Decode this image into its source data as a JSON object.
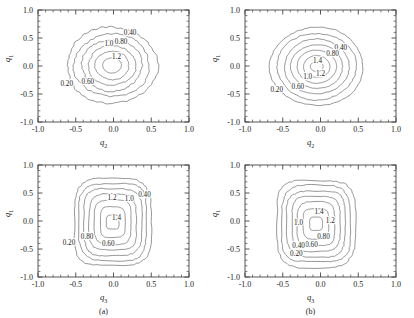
{
  "figure": {
    "type": "contour-figure",
    "panel_count": 4,
    "line_color": "#555555",
    "frame_color": "#444444",
    "background": "#ffffff"
  },
  "axes": {
    "x_ticks": [
      "-1.0",
      "-0.5",
      "0.0",
      "0.5",
      "1.0"
    ],
    "y_ticks": [
      "-1.0",
      "-0.5",
      "0.0",
      "0.5",
      "1.0"
    ],
    "xlim": [
      -1.0,
      1.0
    ],
    "ylim": [
      -1.0,
      1.0
    ],
    "minor_ticks_per_interval": 4,
    "tick_direction": "in",
    "grid": false
  },
  "panels": [
    {
      "id": "top-left",
      "caption": "",
      "xlabel": "q",
      "xlabel_sub": "2",
      "ylabel": "q",
      "ylabel_sub": "1",
      "contour_levels": [
        "0.20",
        "0.60",
        "1.0",
        "1.2",
        "0.80",
        "0.40"
      ],
      "labels": [
        {
          "text": "0.40",
          "x": 0.22,
          "y": 0.55
        },
        {
          "text": "0.80",
          "x": 0.1,
          "y": 0.4
        },
        {
          "text": "1.0",
          "x": -0.06,
          "y": 0.36
        },
        {
          "text": "1.2",
          "x": 0.04,
          "y": 0.13
        },
        {
          "text": "0.60",
          "x": -0.34,
          "y": -0.33
        },
        {
          "text": "0.20",
          "x": -0.62,
          "y": -0.36
        }
      ]
    },
    {
      "id": "top-right",
      "caption": "",
      "xlabel": "q",
      "xlabel_sub": "2",
      "ylabel": "q",
      "ylabel_sub": "1",
      "contour_levels": [
        "0.20",
        "0.60",
        "1.0",
        "1.2",
        "1.4",
        "0.80",
        "0.40"
      ],
      "labels": [
        {
          "text": "0.40",
          "x": 0.27,
          "y": 0.29
        },
        {
          "text": "0.80",
          "x": 0.16,
          "y": 0.18
        },
        {
          "text": "1.4",
          "x": -0.04,
          "y": 0.05
        },
        {
          "text": "1.2",
          "x": 0.0,
          "y": -0.18
        },
        {
          "text": "1.0",
          "x": -0.17,
          "y": -0.24
        },
        {
          "text": "0.60",
          "x": -0.3,
          "y": -0.41
        },
        {
          "text": "0.20",
          "x": -0.58,
          "y": -0.46
        }
      ]
    },
    {
      "id": "bottom-left",
      "caption": "(a)",
      "xlabel": "q",
      "xlabel_sub": "3",
      "ylabel": "q",
      "ylabel_sub": "1",
      "contour_levels": [
        "0.20",
        "0.80",
        "0.60",
        "1.2",
        "1.0",
        "1.4",
        "0.40"
      ],
      "labels": [
        {
          "text": "0.40",
          "x": 0.41,
          "y": 0.42
        },
        {
          "text": "1.0",
          "x": 0.21,
          "y": 0.35
        },
        {
          "text": "1.2",
          "x": -0.02,
          "y": 0.38
        },
        {
          "text": "1.4",
          "x": 0.04,
          "y": 0.02
        },
        {
          "text": "0.80",
          "x": -0.35,
          "y": -0.32
        },
        {
          "text": "0.20",
          "x": -0.59,
          "y": -0.42
        },
        {
          "text": "0.60",
          "x": -0.07,
          "y": -0.44
        }
      ]
    },
    {
      "id": "bottom-right",
      "caption": "(b)",
      "xlabel": "q",
      "xlabel_sub": "3",
      "ylabel": "q",
      "ylabel_sub": "1",
      "contour_levels": [
        "0.20",
        "0.40",
        "0.60",
        "0.80",
        "1.0",
        "1.2",
        "1.4"
      ],
      "labels": [
        {
          "text": "1.4",
          "x": -0.02,
          "y": 0.12
        },
        {
          "text": "1.2",
          "x": 0.13,
          "y": -0.04
        },
        {
          "text": "1.0",
          "x": -0.29,
          "y": -0.07
        },
        {
          "text": "0.80",
          "x": 0.04,
          "y": -0.33
        },
        {
          "text": "0.60",
          "x": -0.12,
          "y": -0.47
        },
        {
          "text": "0.40",
          "x": -0.29,
          "y": -0.49
        },
        {
          "text": "0.20",
          "x": -0.32,
          "y": -0.62
        }
      ]
    }
  ],
  "chart_data": {
    "type": "line",
    "title": "",
    "subtitle": "",
    "xlabel": "q2 / q3",
    "ylabel": "q1",
    "xlim": [
      -1.0,
      1.0
    ],
    "ylim": [
      -1.0,
      1.0
    ],
    "grid": false,
    "legend_position": "none",
    "plot_kind": "contour",
    "contour_levels": [
      0.2,
      0.4,
      0.6,
      0.8,
      1.0,
      1.2,
      1.4
    ],
    "x_ticks": [
      -1.0,
      -0.5,
      0.0,
      0.5,
      1.0
    ],
    "y_ticks": [
      -1.0,
      -0.5,
      0.0,
      0.5,
      1.0
    ],
    "panels": [
      {
        "name": "top-left",
        "xlabel": "q2",
        "ylabel": "q1",
        "caption": "",
        "levels_shown": [
          0.2,
          0.4,
          0.6,
          0.8,
          1.0,
          1.2
        ],
        "peak_value": 1.3,
        "peak_location": [
          -0.03,
          0.02
        ],
        "shape": "rounded-blob",
        "outer_extent_x": [
          -0.62,
          0.6
        ],
        "outer_extent_y": [
          -0.68,
          0.7
        ]
      },
      {
        "name": "top-right",
        "xlabel": "q2",
        "ylabel": "q1",
        "caption": "",
        "levels_shown": [
          0.2,
          0.4,
          0.6,
          0.8,
          1.0,
          1.2,
          1.4
        ],
        "peak_value": 1.5,
        "peak_location": [
          -0.06,
          0.0
        ],
        "shape": "circular-blob",
        "outer_extent_x": [
          -0.66,
          0.58
        ],
        "outer_extent_y": [
          -0.72,
          0.7
        ]
      },
      {
        "name": "bottom-left",
        "xlabel": "q3",
        "ylabel": "q1",
        "caption": "(a)",
        "levels_shown": [
          0.2,
          0.4,
          0.6,
          0.8,
          1.0,
          1.2,
          1.4
        ],
        "peak_value": 1.5,
        "peak_location": [
          0.0,
          0.0
        ],
        "shape": "rounded-square",
        "outer_extent_x": [
          -0.52,
          0.5
        ],
        "outer_extent_y": [
          -0.8,
          0.76
        ]
      },
      {
        "name": "bottom-right",
        "xlabel": "q3",
        "ylabel": "q1",
        "caption": "(b)",
        "levels_shown": [
          0.2,
          0.4,
          0.6,
          0.8,
          1.0,
          1.2,
          1.4
        ],
        "peak_value": 1.5,
        "peak_location": [
          -0.06,
          0.02
        ],
        "shape": "rounded-square",
        "outer_extent_x": [
          -0.58,
          0.46
        ],
        "outer_extent_y": [
          -0.82,
          0.72
        ]
      }
    ]
  }
}
